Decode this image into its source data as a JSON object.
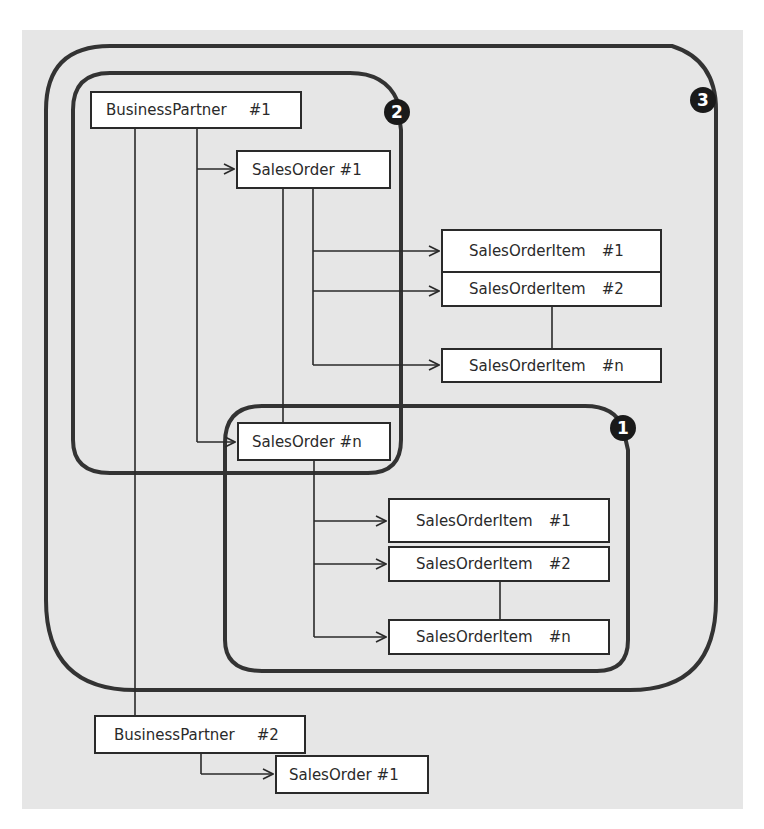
{
  "regions": [
    {
      "id": "1",
      "label": "1"
    },
    {
      "id": "2",
      "label": "2"
    },
    {
      "id": "3",
      "label": "3"
    }
  ],
  "nodes": {
    "bp1": {
      "name": "BusinessPartner",
      "num": "#1"
    },
    "so1": {
      "name": "SalesOrder",
      "num": "#1"
    },
    "soi1_1": {
      "name": "SalesOrderItem",
      "num": "#1"
    },
    "soi1_2": {
      "name": "SalesOrderItem",
      "num": "#2"
    },
    "soi1_n": {
      "name": "SalesOrderItem",
      "num": "#n"
    },
    "son": {
      "name": "SalesOrder",
      "num": "#n"
    },
    "soin_1": {
      "name": "SalesOrderItem",
      "num": "#1"
    },
    "soin_2": {
      "name": "SalesOrderItem",
      "num": "#2"
    },
    "soin_n": {
      "name": "SalesOrderItem",
      "num": "#n"
    },
    "bp2": {
      "name": "BusinessPartner",
      "num": "#2"
    },
    "bp2so1": {
      "name": "SalesOrder",
      "num": "#1"
    }
  },
  "colors": {
    "background": "#e6e6e6",
    "line": "#2a2a2a",
    "badge": "#1a1a1a"
  }
}
